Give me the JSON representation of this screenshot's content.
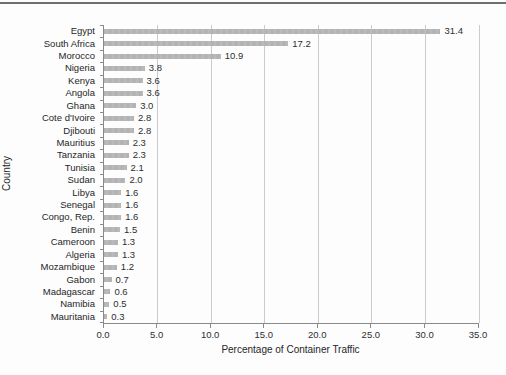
{
  "chart_data": {
    "type": "bar",
    "orientation": "horizontal",
    "title": "",
    "xlabel": "Percentage of Container Traffic",
    "ylabel": "Country",
    "xlim": [
      0,
      35
    ],
    "grid": "vertical",
    "legend": "none",
    "bar_color": "#b5b5b5",
    "gridline_color": "#cbcbcb",
    "axis_color": "#8a8a8a",
    "x_ticks": [
      0,
      5,
      10,
      15,
      20,
      25,
      30,
      35
    ],
    "x_tick_labels": [
      "0.0",
      "5.0",
      "10.0",
      "15.0",
      "20.0",
      "25.0",
      "30.0",
      "35.0"
    ],
    "categories": [
      "Egypt",
      "South Africa",
      "Morocco",
      "Nigeria",
      "Kenya",
      "Angola",
      "Ghana",
      "Cote d'Ivoire",
      "Djibouti",
      "Mauritius",
      "Tanzania",
      "Tunisia",
      "Sudan",
      "Libya",
      "Senegal",
      "Congo, Rep.",
      "Benin",
      "Cameroon",
      "Algeria",
      "Mozambique",
      "Gabon",
      "Madagascar",
      "Namibia",
      "Mauritania"
    ],
    "values": [
      31.4,
      17.2,
      10.9,
      3.8,
      3.6,
      3.6,
      3.0,
      2.8,
      2.8,
      2.3,
      2.3,
      2.1,
      2.0,
      1.6,
      1.6,
      1.6,
      1.5,
      1.3,
      1.3,
      1.2,
      0.7,
      0.6,
      0.5,
      0.3
    ],
    "value_labels": [
      "31.4",
      "17.2",
      "10.9",
      "3.8",
      "3.6",
      "3.6",
      "3.0",
      "2.8",
      "2.8",
      "2.3",
      "2.3",
      "2.1",
      "2.0",
      "1.6",
      "1.6",
      "1.6",
      "1.5",
      "1.3",
      "1.3",
      "1.2",
      "0.7",
      "0.6",
      "0.5",
      "0.3"
    ]
  }
}
